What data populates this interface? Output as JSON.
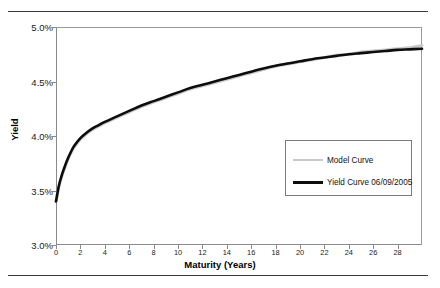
{
  "figure": {
    "background_color": "#ffffff",
    "rule_color": "#3a3a3a",
    "axis_color": "#8a8a8a"
  },
  "axes": {
    "x_title": "Maturity (Years)",
    "y_title": "Yield",
    "x_ticks": [
      "0",
      "2",
      "4",
      "6",
      "8",
      "10",
      "12",
      "14",
      "16",
      "18",
      "20",
      "22",
      "24",
      "26",
      "28"
    ],
    "y_ticks": [
      "3.0%",
      "3.5%",
      "4.0%",
      "4.5%",
      "5.0%"
    ]
  },
  "legend": {
    "items": [
      {
        "label": "Model Curve",
        "color": "#c9c9c9",
        "style": "thin-gray"
      },
      {
        "label": "Yield Curve 06/09/2005",
        "color": "#0d0d0d",
        "style": "thick-black"
      }
    ]
  },
  "chart_data": {
    "type": "line",
    "title": "",
    "xlabel": "Maturity (Years)",
    "ylabel": "Yield",
    "xlim": [
      0,
      30
    ],
    "ylim": [
      3.0,
      5.0
    ],
    "y_unit": "percent",
    "grid": false,
    "legend_position": "center-right",
    "x": [
      0,
      0.25,
      0.5,
      0.75,
      1,
      1.25,
      1.5,
      2,
      2.5,
      3,
      3.5,
      4,
      5,
      6,
      7,
      8,
      9,
      10,
      11,
      12,
      13,
      14,
      15,
      16,
      17,
      18,
      19,
      20,
      21,
      22,
      23,
      24,
      25,
      26,
      27,
      28,
      29,
      30
    ],
    "series": [
      {
        "name": "Model Curve",
        "color": "#c9c9c9",
        "line_width": 3,
        "values": [
          3.4,
          3.54,
          3.64,
          3.72,
          3.79,
          3.85,
          3.9,
          3.97,
          4.02,
          4.06,
          4.09,
          4.12,
          4.17,
          4.22,
          4.27,
          4.31,
          4.35,
          4.39,
          4.43,
          4.46,
          4.49,
          4.52,
          4.55,
          4.58,
          4.61,
          4.64,
          4.66,
          4.68,
          4.7,
          4.72,
          4.74,
          4.75,
          4.77,
          4.78,
          4.79,
          4.8,
          4.81,
          4.83
        ]
      },
      {
        "name": "Yield Curve 06/09/2005",
        "color": "#0d0d0d",
        "line_width": 2.6,
        "values": [
          3.4,
          3.55,
          3.65,
          3.73,
          3.8,
          3.86,
          3.91,
          3.98,
          4.03,
          4.07,
          4.1,
          4.13,
          4.18,
          4.23,
          4.28,
          4.32,
          4.36,
          4.4,
          4.44,
          4.47,
          4.5,
          4.53,
          4.56,
          4.59,
          4.62,
          4.645,
          4.665,
          4.685,
          4.705,
          4.72,
          4.735,
          4.75,
          4.76,
          4.77,
          4.78,
          4.79,
          4.795,
          4.8
        ]
      }
    ]
  }
}
